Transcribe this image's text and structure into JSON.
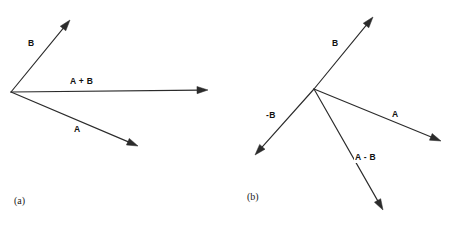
{
  "figure": {
    "width": 452,
    "height": 226,
    "background_color": "#ffffff",
    "stroke_color": "#2b2b2b",
    "label_color": "#111111"
  },
  "panels": [
    {
      "id": "panel-a",
      "caption": "(a)",
      "caption_pos": {
        "x": 14,
        "y": 196
      },
      "origin": {
        "x": 11,
        "y": 92
      },
      "vectors": [
        {
          "name": "B",
          "label": "B",
          "from": {
            "x": 11,
            "y": 92
          },
          "to": {
            "x": 70,
            "y": 20
          },
          "label_pos": {
            "x": 27,
            "y": 38
          }
        },
        {
          "name": "A+B",
          "label": "A + B",
          "from": {
            "x": 11,
            "y": 92
          },
          "to": {
            "x": 208,
            "y": 90
          },
          "label_pos": {
            "x": 69,
            "y": 76
          }
        },
        {
          "name": "A",
          "label": "A",
          "from": {
            "x": 11,
            "y": 92
          },
          "to": {
            "x": 138,
            "y": 146
          },
          "label_pos": {
            "x": 73,
            "y": 124
          }
        }
      ]
    },
    {
      "id": "panel-b",
      "caption": "(b)",
      "caption_pos": {
        "x": 247,
        "y": 192
      },
      "origin": {
        "x": 314,
        "y": 89
      },
      "vectors": [
        {
          "name": "B",
          "label": "B",
          "from": {
            "x": 314,
            "y": 89
          },
          "to": {
            "x": 373,
            "y": 17
          },
          "label_pos": {
            "x": 331,
            "y": 38
          }
        },
        {
          "name": "A",
          "label": "A",
          "from": {
            "x": 314,
            "y": 89
          },
          "to": {
            "x": 441,
            "y": 141
          },
          "label_pos": {
            "x": 391,
            "y": 109
          }
        },
        {
          "name": "-B",
          "label": "-B",
          "from": {
            "x": 314,
            "y": 89
          },
          "to": {
            "x": 255,
            "y": 155
          },
          "label_pos": {
            "x": 265,
            "y": 110
          }
        },
        {
          "name": "A-B",
          "label": "A - B",
          "from": {
            "x": 314,
            "y": 89
          },
          "to": {
            "x": 383,
            "y": 210
          },
          "label_pos": {
            "x": 354,
            "y": 152
          }
        }
      ]
    }
  ]
}
